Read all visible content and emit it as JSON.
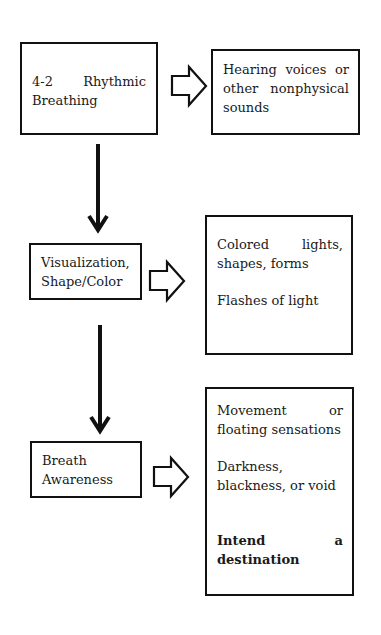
{
  "diagram": {
    "type": "flowchart",
    "steps": [
      {
        "id": "step1",
        "label_parts": [
          "4-2",
          "Rhythmic",
          "Breathing"
        ],
        "label": "4-2 Rhythmic Breathing",
        "effects": [
          {
            "lines": [
              "Hearing voices or",
              "other nonphysical",
              "sounds"
            ],
            "text": "Hearing voices or other nonphysical sounds",
            "bold": false
          }
        ]
      },
      {
        "id": "step2",
        "label_lines": [
          "Visualization,",
          "Shape/Color"
        ],
        "label": "Visualization, Shape/Color",
        "effects": [
          {
            "line1_left": "Colored",
            "line1_right": "lights,",
            "line2": "shapes, forms",
            "text": "Colored lights, shapes, forms",
            "bold": false
          },
          {
            "text": "Flashes of light",
            "bold": false
          }
        ]
      },
      {
        "id": "step3",
        "label_lines": [
          "Breath",
          "Awareness"
        ],
        "label": "Breath Awareness",
        "effects": [
          {
            "line1_left": "Movement",
            "line1_right": "or",
            "line2": "floating sensations",
            "text": "Movement or floating sensations",
            "bold": false
          },
          {
            "line1": "Darkness,",
            "line2": "blackness, or void",
            "text": "Darkness, blackness, or void",
            "bold": false
          },
          {
            "line1_left": "Intend",
            "line1_right": "a",
            "line2": "destination",
            "text": "Intend a destination",
            "bold": true
          }
        ]
      }
    ],
    "connectors": {
      "vertical": [
        {
          "from": "step1",
          "to": "step2",
          "style": "solid-arrow"
        },
        {
          "from": "step2",
          "to": "step3",
          "style": "solid-arrow"
        }
      ],
      "horizontal": [
        {
          "from": "step1",
          "to": "step1-effects",
          "style": "block-arrow-outline"
        },
        {
          "from": "step2",
          "to": "step2-effects",
          "style": "block-arrow-outline"
        },
        {
          "from": "step3",
          "to": "step3-effects",
          "style": "block-arrow-outline"
        }
      ]
    },
    "colors": {
      "stroke": "#111111",
      "background": "#ffffff",
      "text": "#1a1a1a"
    }
  }
}
